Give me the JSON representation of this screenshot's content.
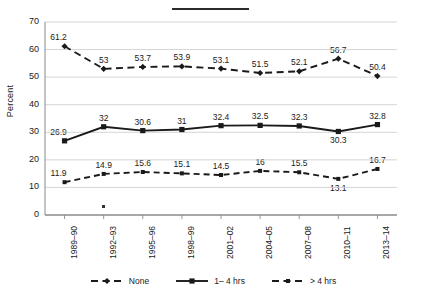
{
  "chart_data": {
    "type": "line",
    "title": "",
    "xlabel": "",
    "ylabel": "Percent",
    "ylim": [
      0,
      70
    ],
    "yticks": [
      0,
      10,
      20,
      30,
      40,
      50,
      60,
      70
    ],
    "ytick_labels": [
      "0",
      "10",
      "20",
      "30",
      "40",
      "50",
      "60",
      "70"
    ],
    "grid": true,
    "grid_axis": "y",
    "legend_position": "bottom",
    "categories": [
      "1989–90",
      "1992–93",
      "1995–96",
      "1998–99",
      "2001–02",
      "2004–05",
      "2007–08",
      "2010–11",
      "2013–14"
    ],
    "series": [
      {
        "name": "None",
        "line_style": "dashed",
        "marker": "diamond",
        "color": "#1a1a1a",
        "values": [
          61.2,
          53,
          53.7,
          53.9,
          53.1,
          51.5,
          52.1,
          56.7,
          50.4
        ],
        "labels": [
          "61.2",
          "53",
          "53.7",
          "53.9",
          "53.1",
          "51.5",
          "52.1",
          "56.7",
          "50.4"
        ]
      },
      {
        "name": "1– 4 hrs",
        "line_style": "solid",
        "marker": "square",
        "color": "#1a1a1a",
        "values": [
          26.9,
          32,
          30.6,
          31,
          32.4,
          32.5,
          32.3,
          30.3,
          32.8
        ],
        "labels": [
          "26.9",
          "32",
          "30.6",
          "31",
          "32.4",
          "32.5",
          "32.3",
          "30.3",
          "32.8"
        ]
      },
      {
        "name": "> 4 hrs",
        "line_style": "dashed",
        "marker": "square-small",
        "color": "#1a1a1a",
        "values": [
          11.9,
          14.9,
          15.6,
          15.1,
          14.5,
          16,
          15.5,
          13.1,
          16.7
        ],
        "labels": [
          "11.9",
          "14.9",
          "15.6",
          "15.1",
          "14.5",
          "16",
          "15.5",
          "13.1",
          "16.7"
        ]
      }
    ]
  },
  "legend": {
    "items": [
      {
        "label": "None",
        "style": "dashed-diamond"
      },
      {
        "label": "1– 4 hrs",
        "style": "solid-square"
      },
      {
        "label": "> 4 hrs",
        "style": "dashed-square"
      }
    ]
  },
  "decorations": {
    "top_rule": true,
    "stray_dot": true
  }
}
